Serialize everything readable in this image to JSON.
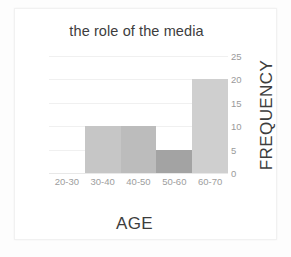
{
  "chart_data": {
    "type": "bar",
    "title": "the role of the media",
    "xlabel": "AGE",
    "ylabel": "FREQUENCY",
    "categories": [
      "20-30",
      "30-40",
      "40-50",
      "50-60",
      "60-70"
    ],
    "values": [
      0,
      10,
      10,
      5,
      20
    ],
    "bar_colors": [
      "#ffffff",
      "#c6c6c6",
      "#bcbcbc",
      "#a3a3a3",
      "#cfcfcf"
    ],
    "ylim": [
      0,
      25
    ],
    "yticks": [
      0,
      5,
      10,
      15,
      20,
      25
    ],
    "ytick_labels": [
      "0",
      "5",
      "10",
      "15",
      "20",
      "25"
    ],
    "grid": true,
    "gridline_color": "#f0f0f0",
    "y_axis_position": "right",
    "legend": "none",
    "bar_gap": 0,
    "background": "#ffffff",
    "frame_color": "#f1f1f1",
    "text_color": "#3d3d3d",
    "tick_text_color": "#9a9a9a"
  }
}
